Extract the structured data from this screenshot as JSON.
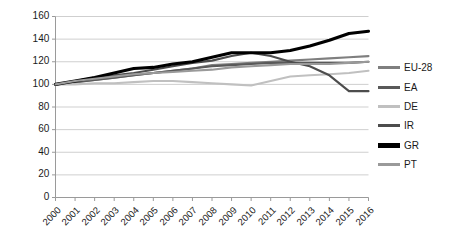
{
  "chart_data": {
    "type": "line",
    "title": "",
    "subtitle": "",
    "xlabel": "",
    "ylabel": "",
    "grid": true,
    "legend_position": "right",
    "xlim": [
      2000,
      2016
    ],
    "ylim": [
      0,
      160
    ],
    "ytick_step": 20,
    "categories": [
      "2000",
      "2001",
      "2002",
      "2003",
      "2004",
      "2005",
      "2006",
      "2007",
      "2008",
      "2009",
      "2010",
      "2011",
      "2012",
      "2013",
      "2014",
      "2015",
      "2016"
    ],
    "ytick_labels": [
      "0",
      "20",
      "40",
      "60",
      "80",
      "100",
      "120",
      "140",
      "160"
    ],
    "series": [
      {
        "name": "EU-28",
        "color": "#7f7f7f",
        "width": 2.1,
        "values": [
          100,
          102,
          104,
          106,
          108,
          110,
          112,
          114,
          117,
          118,
          119,
          120,
          121,
          122,
          123,
          124,
          125
        ]
      },
      {
        "name": "EA",
        "color": "#595959",
        "width": 2.1,
        "values": [
          100,
          102,
          104,
          106,
          108,
          110,
          112,
          114,
          116,
          117,
          118,
          119,
          119,
          119,
          119,
          119,
          120
        ]
      },
      {
        "name": "DE",
        "color": "#c0c0c0",
        "width": 2.1,
        "values": [
          100,
          100,
          101,
          101,
          102,
          103,
          103,
          102,
          101,
          100,
          99,
          103,
          107,
          108,
          109,
          110,
          112
        ]
      },
      {
        "name": "IR",
        "color": "#4d4d4d",
        "width": 2.1,
        "values": [
          100,
          103,
          106,
          108,
          110,
          113,
          116,
          119,
          121,
          125,
          128,
          125,
          120,
          116,
          108,
          94,
          94
        ]
      },
      {
        "name": "GR",
        "color": "#000000",
        "width": 3.1,
        "values": [
          100,
          103,
          106,
          110,
          114,
          115,
          118,
          120,
          124,
          128,
          128,
          128,
          130,
          134,
          139,
          145,
          147
        ]
      },
      {
        "name": "PT",
        "color": "#9a9a9a",
        "width": 2.1,
        "values": [
          100,
          103,
          105,
          107,
          109,
          110,
          111,
          112,
          113,
          115,
          116,
          117,
          118,
          118,
          118,
          119,
          120
        ]
      }
    ]
  },
  "legend": {
    "items": [
      {
        "label": "EU-28",
        "color": "#7f7f7f",
        "thickness": 3
      },
      {
        "label": "EA",
        "color": "#595959",
        "thickness": 3
      },
      {
        "label": "DE",
        "color": "#c0c0c0",
        "thickness": 3
      },
      {
        "label": "IR",
        "color": "#4d4d4d",
        "thickness": 3
      },
      {
        "label": "GR",
        "color": "#000000",
        "thickness": 4.5
      },
      {
        "label": "PT",
        "color": "#9a9a9a",
        "thickness": 3
      }
    ]
  },
  "axes": {
    "axis_color": "#9a9a9a",
    "grid_color": "#cfcfcf"
  }
}
